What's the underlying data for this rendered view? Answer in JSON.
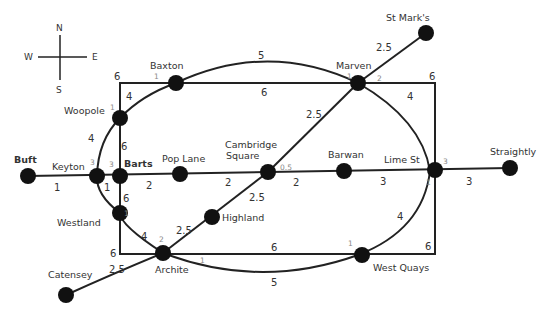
{
  "compass": {
    "north": "N",
    "south": "S",
    "east": "E",
    "west": "W"
  },
  "stations": {
    "st_marks": "St Mark's",
    "baxton": "Baxton",
    "marven": "Marven",
    "woopole": "Woopole",
    "buft": "Buft",
    "keyton": "Keyton",
    "barts": "Barts",
    "pop_lane": "Pop Lane",
    "cambridge_1": "Cambridge",
    "cambridge_2": "Square",
    "barwan": "Barwan",
    "lime_st": "Lime St",
    "straightly": "Straightly",
    "highland": "Highland",
    "westland": "Westland",
    "archite": "Archite",
    "catensey": "Catensey",
    "west_quays": "West Quays"
  },
  "weights": {
    "marven_stmarks": "2.5",
    "baxton_marven_arc": "5",
    "baxton_marven_rect": "6",
    "rect_topleft": "6",
    "rect_topright": "6",
    "woopole_baxton": "4",
    "marven_lime": "4",
    "cambridge_marven": "2.5",
    "keyton_woopole": "4",
    "woopole_barts": "6",
    "buft_keyton": "1",
    "keyton_barts": "1",
    "barts_pop": "2",
    "pop_cambridge": "2",
    "cambridge_barwan": "2",
    "barwan_lime": "3",
    "lime_straightly": "3",
    "cambridge_highland": "2.5",
    "highland_archite": "2.5",
    "barts_westland": "6",
    "westland_archite": "4",
    "rect_bottomleft": "6",
    "catensey_archite": "2.5",
    "archite_westquays_rect": "6",
    "archite_westquays_arc": "5",
    "westquays_lime": "4",
    "rect_bottomright": "6"
  },
  "small_labels": {
    "baxton": "1",
    "woopole": "1",
    "marven_1": "1",
    "marven_2": "2",
    "keyton": "3",
    "barts": "3",
    "cambridge": "0.5",
    "lime_1": "3",
    "lime_2": "1",
    "westland": "1",
    "archite_1": "2",
    "archite_2": "1",
    "westquays": "1"
  }
}
